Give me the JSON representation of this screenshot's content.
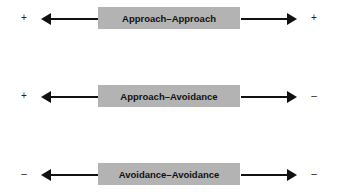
{
  "rows": [
    {
      "label": "Approach–Approach",
      "left_sign": "+",
      "right_sign": "+"
    },
    {
      "label": "Approach–Avoidance",
      "left_sign": "+",
      "right_sign": "–"
    },
    {
      "label": "Avoidance–Avoidance",
      "left_sign": "–",
      "right_sign": "–"
    }
  ],
  "colors": {
    "box": "#b3b3b3",
    "arrow": "#111111"
  }
}
